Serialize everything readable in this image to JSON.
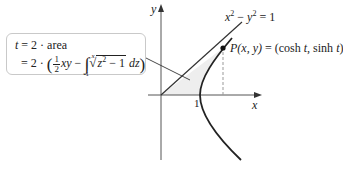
{
  "figure": {
    "axes": {
      "x_label": "x",
      "y_label": "y",
      "tick_label_1": "1"
    },
    "curve_equation": {
      "lhs_x": "x",
      "exp_x": "2",
      "minus": " − ",
      "lhs_y": "y",
      "exp_y": "2",
      "rhs": " = 1"
    },
    "point_label": {
      "prefix": "P",
      "args": "(x, y)",
      "equals": " = (cosh ",
      "t1": "t",
      "mid": ", sinh ",
      "t2": "t",
      "close": ")"
    },
    "callout": {
      "line1_t": "t",
      "line1_rest": " = 2 · area",
      "line2_prefix": "= 2 · ",
      "open_paren": "(",
      "frac_num": "1",
      "frac_den": "2",
      "xy": "xy",
      "minus": " − ",
      "int_upper": "x",
      "int_lower": "1",
      "radicand_z": "z",
      "radicand_exp": "2",
      "radicand_rest": " − 1",
      "dz": " dz",
      "close_paren": ")"
    },
    "colors": {
      "stroke": "#222222",
      "axis": "#555555",
      "shade": "#eeeeee",
      "dashed": "#999999",
      "box_border": "#c9c9c9"
    }
  }
}
